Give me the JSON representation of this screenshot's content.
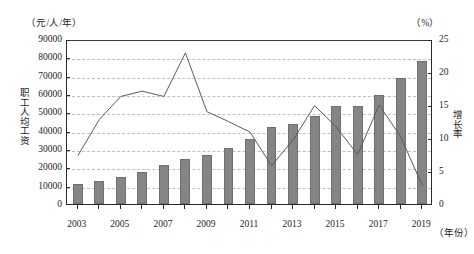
{
  "chart_data": {
    "type": "bar",
    "title": "",
    "xlabel": "（年份）",
    "ylabel": "职工人均工资",
    "y2label": "增长率",
    "unit_left": "（元/人/年）",
    "unit_right": "（%）",
    "grid": true,
    "legend_position": "none",
    "ylim": [
      0,
      90000
    ],
    "y2lim": [
      0,
      25
    ],
    "yticks": [
      "0",
      "10000",
      "20000",
      "30000",
      "40000",
      "50000",
      "60000",
      "70000",
      "80000",
      "90000"
    ],
    "y2ticks": [
      "0",
      "5",
      "10",
      "15",
      "20",
      "25"
    ],
    "categories": [
      2003,
      2004,
      2005,
      2006,
      2007,
      2008,
      2009,
      2010,
      2011,
      2012,
      2013,
      2014,
      2015,
      2016,
      2017,
      2018,
      2019
    ],
    "xtick_labels": [
      "2003",
      "2005",
      "2007",
      "2009",
      "2011",
      "2013",
      "2015",
      "2017",
      "2019"
    ],
    "series": [
      {
        "name": "职工人均工资",
        "kind": "bar",
        "axis": "left",
        "color": "#858585",
        "values": [
          10800,
          12600,
          15000,
          17500,
          21500,
          24300,
          26800,
          30600,
          35300,
          41800,
          43500,
          47800,
          53600,
          53400,
          59600,
          68500,
          78000
        ]
      },
      {
        "name": "增长率",
        "kind": "line",
        "axis": "right",
        "color": "#5a5a5a",
        "values": [
          7.6,
          13.1,
          16.6,
          17.4,
          16.6,
          23.2,
          14.3,
          12.8,
          11.2,
          6.1,
          10.0,
          15.2,
          12.0,
          7.8,
          15.3,
          10.5,
          3.1
        ]
      }
    ]
  }
}
